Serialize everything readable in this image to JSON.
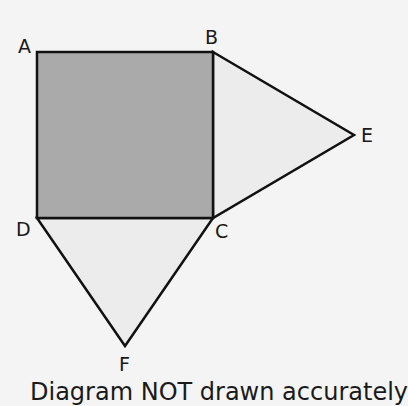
{
  "diagram": {
    "type": "geometry",
    "shapes": {
      "square": {
        "name": "ABCD",
        "vertices": [
          "A",
          "B",
          "C",
          "D"
        ],
        "fill": "#aaaaaa"
      },
      "triangle_right": {
        "name": "BCE",
        "vertices": [
          "B",
          "E",
          "C"
        ],
        "fill": "#ececec"
      },
      "triangle_bottom": {
        "name": "DCF",
        "vertices": [
          "D",
          "C",
          "F"
        ],
        "fill": "#ececec"
      }
    },
    "points": {
      "A": {
        "label": "A",
        "x": 37,
        "y": 52
      },
      "B": {
        "label": "B",
        "x": 213,
        "y": 52
      },
      "C": {
        "label": "C",
        "x": 213,
        "y": 218
      },
      "D": {
        "label": "D",
        "x": 37,
        "y": 218
      },
      "E": {
        "label": "E",
        "x": 354,
        "y": 135
      },
      "F": {
        "label": "F",
        "x": 125,
        "y": 346
      }
    },
    "stroke_color": "#111111",
    "background": "#f4f4f4"
  },
  "labels": {
    "A": "A",
    "B": "B",
    "C": "C",
    "D": "D",
    "E": "E",
    "F": "F"
  },
  "caption": "Diagram NOT drawn accurately"
}
